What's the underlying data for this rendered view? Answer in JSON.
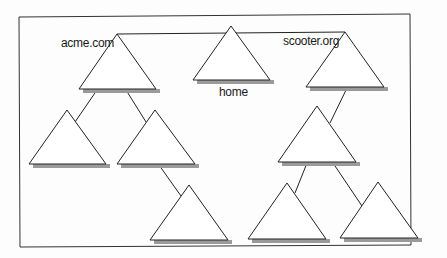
{
  "diagram": {
    "title": "",
    "labels": {
      "acme": "acme.com",
      "home": "home",
      "scooter": "scooter.org"
    },
    "colors": {
      "stroke": "#222222",
      "shadow": "#9a9a9a",
      "fill": "#ffffff",
      "border": "#333333"
    },
    "nodes": [
      {
        "id": "acme",
        "label": "acme.com",
        "level": 1
      },
      {
        "id": "home",
        "label": "home",
        "level": 1
      },
      {
        "id": "scooter",
        "label": "scooter.org",
        "level": 1
      },
      {
        "id": "acme-child-1",
        "label": "",
        "level": 2,
        "parent": "acme"
      },
      {
        "id": "acme-child-2",
        "label": "",
        "level": 2,
        "parent": "acme"
      },
      {
        "id": "acme-grandchild-1",
        "label": "",
        "level": 3,
        "parent": "acme-child-2"
      },
      {
        "id": "scooter-child-1",
        "label": "",
        "level": 2,
        "parent": "scooter"
      },
      {
        "id": "scooter-grandchild-1",
        "label": "",
        "level": 3,
        "parent": "scooter-child-1"
      },
      {
        "id": "scooter-grandchild-2",
        "label": "",
        "level": 3,
        "parent": "scooter-child-1"
      }
    ],
    "edges": [
      [
        "acme",
        "scooter"
      ],
      [
        "acme",
        "acme-child-1"
      ],
      [
        "acme",
        "acme-child-2"
      ],
      [
        "acme-child-2",
        "acme-grandchild-1"
      ],
      [
        "scooter",
        "scooter-child-1"
      ],
      [
        "scooter-child-1",
        "scooter-grandchild-1"
      ],
      [
        "scooter-child-1",
        "scooter-grandchild-2"
      ]
    ]
  }
}
